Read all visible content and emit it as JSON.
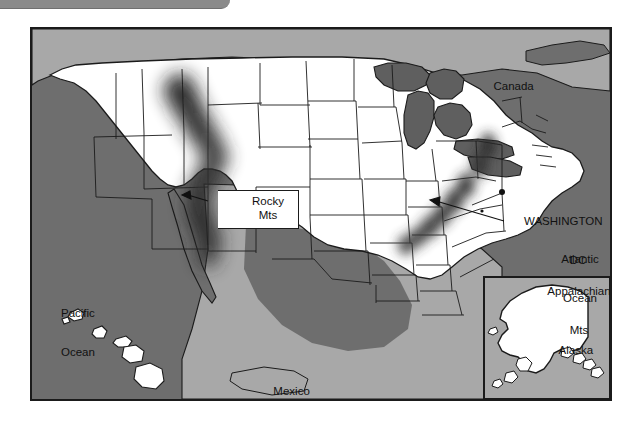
{
  "window": {
    "toolbar_visible": true
  },
  "map": {
    "title": "United States relief map",
    "frame": {
      "x": 30,
      "y": 27,
      "width": 582,
      "height": 374
    },
    "colors": {
      "ocean": "#6e6e6e",
      "land_foreign": "#a8a8a8",
      "land_us": "#ffffff",
      "lakes": "#5f5f5f",
      "border": "#1b1b1b",
      "shading": "#2b2b2b",
      "toolbar": "#8a8a8a"
    },
    "labels": [
      {
        "id": "canada",
        "text": "Canada",
        "kind": "country"
      },
      {
        "id": "mexico",
        "text": "Mexico",
        "kind": "country"
      },
      {
        "id": "pacific",
        "text": "Pacific\nOcean",
        "kind": "ocean"
      },
      {
        "id": "atlantic",
        "text": "Atlantic\nOcean",
        "kind": "ocean"
      },
      {
        "id": "washington",
        "text": "WASHINGTON\nDC",
        "kind": "city"
      },
      {
        "id": "appalachian",
        "text": "Appalachian\nMts",
        "kind": "mountains"
      },
      {
        "id": "rocky",
        "text": "Rocky\nMts",
        "kind": "mountains"
      },
      {
        "id": "alaska",
        "text": "Alaska",
        "kind": "state-inset"
      }
    ],
    "label_text": {
      "canada": "Canada",
      "mexico": "Mexico",
      "pacific_line1": "Pacific",
      "pacific_line2": "Ocean",
      "atlantic_line1": "Atlantic",
      "atlantic_line2": "Ocean",
      "washington_line1": "WASHINGTON",
      "washington_line2": "DC",
      "appalachian_line1": "Appalachian",
      "appalachian_line2": "Mts",
      "rocky_line1": "Rocky",
      "rocky_line2": "Mts",
      "alaska": "Alaska",
      "scale": "100°"
    },
    "annotations": [
      {
        "id": "rocky-arrow",
        "points_to": "Rocky Mountains shaded band"
      },
      {
        "id": "appalachian-arrow",
        "points_to": "Appalachian Mountains shaded band"
      }
    ],
    "inset": {
      "name": "Alaska",
      "scale_label": "100°",
      "box": {
        "x": 484,
        "y": 277,
        "width": 128,
        "height": 124
      }
    },
    "shaded_regions": [
      {
        "name": "Rocky Mts",
        "orientation": "NW-SE band through Idaho, Montana, Wyoming, Colorado, New Mexico"
      },
      {
        "name": "Appalachian Mts",
        "orientation": "NE-SW band through Pennsylvania, Virginia, Tennessee, Georgia"
      }
    ]
  }
}
